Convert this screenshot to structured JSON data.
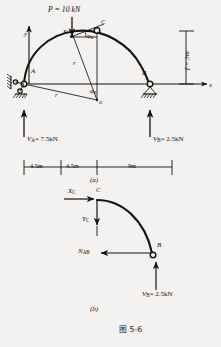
{
  "figure": {
    "caption": "图 5-6",
    "panel_a_label": "(a)",
    "panel_b_label": "(b)",
    "background_color": "#f3f2f0",
    "ink_color": "#15130f"
  },
  "panel_a": {
    "title_role": "three-hinged arch ABC with point load",
    "axes": {
      "y_label": "y",
      "x_label": "x"
    },
    "points": {
      "A": "A",
      "B": "B",
      "C": "C",
      "K": "K",
      "o": "o"
    },
    "load": {
      "label": "P = 10 kN",
      "direction": "downward at point K"
    },
    "angle_label": "φ",
    "angle_sub": "K",
    "center_angle_label": "φ",
    "center_angle_sub": "K",
    "radius_label_upper": "r",
    "radius_label_lower": "r",
    "rise": {
      "label": "f = 3m"
    },
    "reactions": [
      {
        "name": "V",
        "sub": "A",
        "value": "= 7.5kN",
        "full": "V_A = 7.5kN",
        "direction": "up"
      },
      {
        "name": "V",
        "sub": "B",
        "value": "= 2.5kN",
        "full": "V_B = 2.5kN",
        "direction": "up"
      }
    ],
    "dimensions": [
      {
        "label": "4.5m"
      },
      {
        "label": "4.5m"
      },
      {
        "label": "9m"
      }
    ],
    "supports": {
      "A": "pinned-support-hatched",
      "B": "roller-support-hatched"
    }
  },
  "panel_b": {
    "title_role": "free body diagram of segment CB",
    "points": {
      "C": "C",
      "B": "B"
    },
    "forces": [
      {
        "name": "X",
        "sub": "C",
        "full": "X_C",
        "direction": "right-arrow at C"
      },
      {
        "name": "Y",
        "sub": "C",
        "full": "Y_C",
        "direction": "down-arrow at C"
      },
      {
        "name": "N",
        "sub": "AB",
        "full": "N_AB",
        "direction": "left-arrow at B"
      },
      {
        "name": "V",
        "sub": "B",
        "value": "= 2.5kN",
        "full": "V_B = 2.5kN",
        "direction": "up-arrow at B"
      }
    ]
  }
}
